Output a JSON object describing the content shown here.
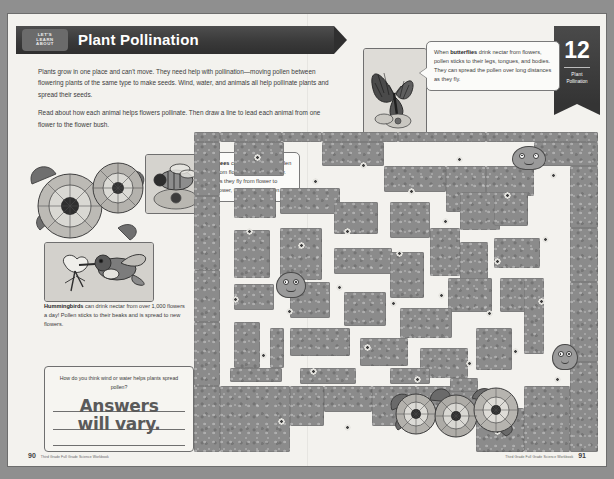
{
  "header": {
    "eyebrow_line1": "LET'S",
    "eyebrow_line2": "LEARN",
    "eyebrow_line3": "ABOUT",
    "title": "Plant Pollination"
  },
  "chapter_tab": {
    "number": "12",
    "label_line1": "Plant",
    "label_line2": "Pollination"
  },
  "intro": {
    "paragraph1": "Plants grow in one place and can't move. They need help with pollination—moving pollen between flowering plants of the same type to make seeds. Wind, water, and animals all help pollinate plants and spread their seeds.",
    "paragraph2": "Read about how each animal helps flowers pollinate. Then draw a line to lead each animal from one flower to the flower bush."
  },
  "callouts": {
    "butterfly": {
      "lead": "butterflies",
      "before": "When ",
      "after": " drink nectar from flowers, pollen sticks to their legs, tongues, and bodies. They can spread the pollen over long distances as they fly."
    },
    "bee": {
      "lead": "Bees",
      "before": "",
      "after": " collect nectar and pollen from flowers to make honey. As they fly from flower to flower, they spread pollen."
    },
    "hummingbird": {
      "lead": "Hummingbirds",
      "before": "",
      "after": " can drink nectar from over 1,000 flowers a day! Pollen sticks to their beaks and is spread to new flowers."
    }
  },
  "answer_box": {
    "question": "How do you think wind or water helps plants spread pollen?",
    "answer_line1": "Answers",
    "answer_line2": "will vary."
  },
  "photos": {
    "butterfly_alt": "butterfly-on-flower-photo",
    "bee_alt": "bee-on-flower-photo",
    "hummingbird_alt": "hummingbird-at-flower-illustration"
  },
  "footer": {
    "left_page": "90",
    "left_source": "Third Grade Full Grade Science Workbook",
    "right_page": "91",
    "right_source": "Third Grade Full Grade Science Workbook"
  },
  "colors": {
    "page_background": "#f3f2ee",
    "banner_dark": "#3a3a3a",
    "hedge_gray": "#8b8b8b",
    "path_white": "#f3f2ee",
    "outer_gray": "#8f8f8f"
  },
  "maze": {
    "hedges": [
      [
        0,
        0,
        26,
        10
      ],
      [
        26,
        0,
        62,
        10
      ],
      [
        88,
        0,
        40,
        10
      ],
      [
        128,
        0,
        76,
        10
      ],
      [
        204,
        0,
        88,
        10
      ],
      [
        292,
        0,
        112,
        10
      ],
      [
        0,
        10,
        26,
        54
      ],
      [
        0,
        64,
        26,
        74
      ],
      [
        0,
        138,
        26,
        52
      ],
      [
        0,
        190,
        26,
        64
      ],
      [
        0,
        254,
        26,
        66
      ],
      [
        26,
        254,
        70,
        66
      ],
      [
        96,
        254,
        34,
        40
      ],
      [
        130,
        254,
        48,
        26
      ],
      [
        178,
        254,
        44,
        40
      ],
      [
        222,
        254,
        60,
        26
      ],
      [
        282,
        276,
        48,
        44
      ],
      [
        330,
        254,
        46,
        66
      ],
      [
        376,
        230,
        28,
        90
      ],
      [
        376,
        150,
        28,
        80
      ],
      [
        376,
        96,
        28,
        54
      ],
      [
        376,
        34,
        28,
        62
      ],
      [
        340,
        10,
        64,
        24
      ],
      [
        292,
        34,
        48,
        30
      ],
      [
        252,
        34,
        40,
        46
      ],
      [
        190,
        34,
        62,
        26
      ],
      [
        128,
        10,
        62,
        24
      ],
      [
        40,
        10,
        50,
        34
      ],
      [
        40,
        56,
        42,
        30
      ],
      [
        40,
        98,
        36,
        48
      ],
      [
        86,
        56,
        60,
        26
      ],
      [
        86,
        96,
        42,
        52
      ],
      [
        140,
        70,
        44,
        32
      ],
      [
        140,
        116,
        58,
        26
      ],
      [
        196,
        70,
        40,
        36
      ],
      [
        196,
        120,
        34,
        46
      ],
      [
        236,
        96,
        30,
        48
      ],
      [
        266,
        60,
        40,
        38
      ],
      [
        266,
        110,
        28,
        42
      ],
      [
        300,
        60,
        34,
        34
      ],
      [
        300,
        106,
        46,
        30
      ],
      [
        306,
        146,
        40,
        34
      ],
      [
        254,
        146,
        44,
        34
      ],
      [
        206,
        176,
        52,
        30
      ],
      [
        150,
        160,
        42,
        34
      ],
      [
        96,
        150,
        40,
        36
      ],
      [
        96,
        196,
        60,
        28
      ],
      [
        166,
        206,
        48,
        28
      ],
      [
        226,
        216,
        48,
        30
      ],
      [
        282,
        196,
        36,
        42
      ],
      [
        330,
        146,
        20,
        76
      ],
      [
        40,
        152,
        40,
        26
      ],
      [
        40,
        190,
        26,
        46
      ],
      [
        76,
        196,
        14,
        40
      ],
      [
        106,
        236,
        56,
        16
      ],
      [
        196,
        236,
        40,
        16
      ],
      [
        256,
        246,
        28,
        14
      ],
      [
        36,
        236,
        52,
        14
      ]
    ],
    "blooms": [
      [
        60,
        22
      ],
      [
        118,
        46
      ],
      [
        166,
        30
      ],
      [
        214,
        56
      ],
      [
        262,
        24
      ],
      [
        310,
        60
      ],
      [
        356,
        40
      ],
      [
        52,
        96
      ],
      [
        104,
        110
      ],
      [
        150,
        96
      ],
      [
        202,
        118
      ],
      [
        248,
        86
      ],
      [
        300,
        126
      ],
      [
        348,
        104
      ],
      [
        38,
        164
      ],
      [
        92,
        176
      ],
      [
        142,
        152
      ],
      [
        196,
        168
      ],
      [
        244,
        160
      ],
      [
        292,
        178
      ],
      [
        344,
        166
      ],
      [
        66,
        220
      ],
      [
        116,
        236
      ],
      [
        170,
        212
      ],
      [
        220,
        244
      ],
      [
        272,
        228
      ],
      [
        318,
        216
      ],
      [
        360,
        244
      ],
      [
        84,
        286
      ],
      [
        150,
        292
      ],
      [
        236,
        284
      ],
      [
        300,
        296
      ]
    ],
    "critters": [
      {
        "name": "maze-critter-bee-start",
        "x": 82,
        "y": 140,
        "w": 30,
        "h": 26
      },
      {
        "name": "maze-critter-butterfly-start",
        "x": 318,
        "y": 14,
        "w": 34,
        "h": 24
      },
      {
        "name": "maze-critter-hummingbird-start",
        "x": 358,
        "y": 212,
        "w": 26,
        "h": 26
      }
    ]
  }
}
